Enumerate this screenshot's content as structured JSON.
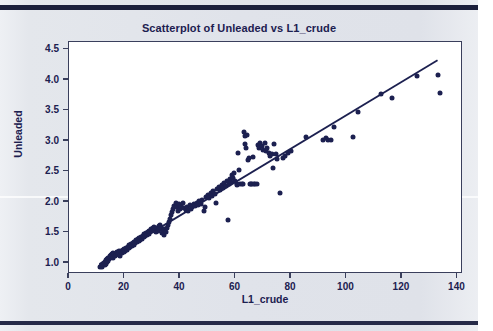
{
  "chart_data": {
    "type": "scatter",
    "title": "Scatterplot of Unleaded vs L1_crude",
    "xlabel": "L1_crude",
    "ylabel": "Unleaded",
    "xlim": [
      0,
      142
    ],
    "ylim": [
      0.82,
      4.62
    ],
    "xticks": [
      0,
      20,
      40,
      60,
      80,
      100,
      120,
      140
    ],
    "yticks": [
      "1.0",
      "1.5",
      "2.0",
      "2.5",
      "3.0",
      "3.5",
      "4.0",
      "4.5"
    ],
    "grid": false,
    "legend": "none",
    "marker_color": "#1c2050",
    "line_color": "#1c2050",
    "frame_color": "#3a3f5c",
    "background": "#ffffff",
    "fit_line": {
      "type": "linear",
      "x_start": 11.0,
      "y_start": 0.95,
      "x_end": 133.5,
      "y_end": 4.32,
      "slope": 0.0275,
      "intercept": 0.647
    },
    "points": [
      [
        11.2,
        0.93
      ],
      [
        11.6,
        0.95
      ],
      [
        12.0,
        0.94
      ],
      [
        12.1,
        0.98
      ],
      [
        12.4,
        0.96
      ],
      [
        12.6,
        1.0
      ],
      [
        12.8,
        0.97
      ],
      [
        13.0,
        1.02
      ],
      [
        13.2,
        0.99
      ],
      [
        13.4,
        1.05
      ],
      [
        13.6,
        1.01
      ],
      [
        13.8,
        1.07
      ],
      [
        14.0,
        1.04
      ],
      [
        14.2,
        1.09
      ],
      [
        14.4,
        1.06
      ],
      [
        14.6,
        1.11
      ],
      [
        14.8,
        1.08
      ],
      [
        15.0,
        1.13
      ],
      [
        15.2,
        1.1
      ],
      [
        15.4,
        1.15
      ],
      [
        15.6,
        1.12
      ],
      [
        15.8,
        1.17
      ],
      [
        16.0,
        1.09
      ],
      [
        16.2,
        1.14
      ],
      [
        16.5,
        1.11
      ],
      [
        16.8,
        1.16
      ],
      [
        17.0,
        1.13
      ],
      [
        17.3,
        1.18
      ],
      [
        17.6,
        1.15
      ],
      [
        17.9,
        1.2
      ],
      [
        18.2,
        1.17
      ],
      [
        18.5,
        1.12
      ],
      [
        18.8,
        1.19
      ],
      [
        19.1,
        1.16
      ],
      [
        19.4,
        1.21
      ],
      [
        19.7,
        1.18
      ],
      [
        20.0,
        1.23
      ],
      [
        20.3,
        1.2
      ],
      [
        20.6,
        1.25
      ],
      [
        20.9,
        1.22
      ],
      [
        21.2,
        1.27
      ],
      [
        21.5,
        1.24
      ],
      [
        21.8,
        1.29
      ],
      [
        22.1,
        1.26
      ],
      [
        22.4,
        1.31
      ],
      [
        22.7,
        1.28
      ],
      [
        23.0,
        1.33
      ],
      [
        23.3,
        1.3
      ],
      [
        23.6,
        1.35
      ],
      [
        23.9,
        1.32
      ],
      [
        24.2,
        1.37
      ],
      [
        24.5,
        1.34
      ],
      [
        24.8,
        1.39
      ],
      [
        25.1,
        1.36
      ],
      [
        25.4,
        1.41
      ],
      [
        25.7,
        1.38
      ],
      [
        26.0,
        1.43
      ],
      [
        26.3,
        1.4
      ],
      [
        26.6,
        1.45
      ],
      [
        26.9,
        1.42
      ],
      [
        27.2,
        1.47
      ],
      [
        27.5,
        1.44
      ],
      [
        27.8,
        1.49
      ],
      [
        28.1,
        1.46
      ],
      [
        28.4,
        1.51
      ],
      [
        28.7,
        1.48
      ],
      [
        29.0,
        1.53
      ],
      [
        29.3,
        1.5
      ],
      [
        29.6,
        1.55
      ],
      [
        29.9,
        1.52
      ],
      [
        30.2,
        1.57
      ],
      [
        30.5,
        1.54
      ],
      [
        30.8,
        1.59
      ],
      [
        31.1,
        1.56
      ],
      [
        31.4,
        1.51
      ],
      [
        31.7,
        1.58
      ],
      [
        32.0,
        1.53
      ],
      [
        32.3,
        1.6
      ],
      [
        32.6,
        1.55
      ],
      [
        32.9,
        1.62
      ],
      [
        33.2,
        1.57
      ],
      [
        33.5,
        1.49
      ],
      [
        33.8,
        1.52
      ],
      [
        34.1,
        1.46
      ],
      [
        34.4,
        1.55
      ],
      [
        34.8,
        1.5
      ],
      [
        35.2,
        1.58
      ],
      [
        35.6,
        1.63
      ],
      [
        36.0,
        1.67
      ],
      [
        36.4,
        1.72
      ],
      [
        36.8,
        1.78
      ],
      [
        37.2,
        1.83
      ],
      [
        37.6,
        1.88
      ],
      [
        38.0,
        1.94
      ],
      [
        38.4,
        1.99
      ],
      [
        38.8,
        1.91
      ],
      [
        39.2,
        1.86
      ],
      [
        39.6,
        1.96
      ],
      [
        40.0,
        1.89
      ],
      [
        40.5,
        1.93
      ],
      [
        41.0,
        1.98
      ],
      [
        41.5,
        1.9
      ],
      [
        42.0,
        1.87
      ],
      [
        42.5,
        1.92
      ],
      [
        43.0,
        1.85
      ],
      [
        43.5,
        1.95
      ],
      [
        44.0,
        1.88
      ],
      [
        44.5,
        1.91
      ],
      [
        45.0,
        1.96
      ],
      [
        45.5,
        1.93
      ],
      [
        46.0,
        1.99
      ],
      [
        46.5,
        1.95
      ],
      [
        47.0,
        2.01
      ],
      [
        47.5,
        1.97
      ],
      [
        48.0,
        2.04
      ],
      [
        48.5,
        1.86
      ],
      [
        49.0,
        1.91
      ],
      [
        49.5,
        2.08
      ],
      [
        50.0,
        2.12
      ],
      [
        50.5,
        2.07
      ],
      [
        51.0,
        2.15
      ],
      [
        51.5,
        2.1
      ],
      [
        52.0,
        2.18
      ],
      [
        52.5,
        2.13
      ],
      [
        53.0,
        1.98
      ],
      [
        53.5,
        2.21
      ],
      [
        54.0,
        2.25
      ],
      [
        54.5,
        2.2
      ],
      [
        55.0,
        2.28
      ],
      [
        55.5,
        2.23
      ],
      [
        56.0,
        2.31
      ],
      [
        56.5,
        2.26
      ],
      [
        57.0,
        2.34
      ],
      [
        57.3,
        1.7
      ],
      [
        57.6,
        2.29
      ],
      [
        58.0,
        2.37
      ],
      [
        58.4,
        2.32
      ],
      [
        58.8,
        2.44
      ],
      [
        59.2,
        2.4
      ],
      [
        59.6,
        2.48
      ],
      [
        60.0,
        2.35
      ],
      [
        60.4,
        2.3
      ],
      [
        60.6,
        2.28
      ],
      [
        61.0,
        2.8
      ],
      [
        61.4,
        2.52
      ],
      [
        61.8,
        2.3
      ],
      [
        62.2,
        2.3
      ],
      [
        62.6,
        2.29
      ],
      [
        63.0,
        3.14
      ],
      [
        63.3,
        3.08
      ],
      [
        63.6,
        2.95
      ],
      [
        63.9,
        2.88
      ],
      [
        64.2,
        3.1
      ],
      [
        64.5,
        2.69
      ],
      [
        64.8,
        2.72
      ],
      [
        65.2,
        2.3
      ],
      [
        65.6,
        2.29
      ],
      [
        66.0,
        2.3
      ],
      [
        66.4,
        2.74
      ],
      [
        66.8,
        2.3
      ],
      [
        67.2,
        2.3
      ],
      [
        67.6,
        2.29
      ],
      [
        68.0,
        2.93
      ],
      [
        68.5,
        2.88
      ],
      [
        69.0,
        2.97
      ],
      [
        69.5,
        2.92
      ],
      [
        70.0,
        2.85
      ],
      [
        70.5,
        2.96
      ],
      [
        71.0,
        2.83
      ],
      [
        71.5,
        2.88
      ],
      [
        72.0,
        2.8
      ],
      [
        72.5,
        2.76
      ],
      [
        73.0,
        2.79
      ],
      [
        73.5,
        2.56
      ],
      [
        74.0,
        2.95
      ],
      [
        74.5,
        2.78
      ],
      [
        75.0,
        2.7
      ],
      [
        76.0,
        2.15
      ],
      [
        77.0,
        2.72
      ],
      [
        78.0,
        2.75
      ],
      [
        79.0,
        2.81
      ],
      [
        80.0,
        2.83
      ],
      [
        85.5,
        3.07
      ],
      [
        91.5,
        3.02
      ],
      [
        92.5,
        3.04
      ],
      [
        93.5,
        3.01
      ],
      [
        94.5,
        3.02
      ],
      [
        95.5,
        3.23
      ],
      [
        102.5,
        3.06
      ],
      [
        104.0,
        3.47
      ],
      [
        112.5,
        3.77
      ],
      [
        116.5,
        3.71
      ],
      [
        125.5,
        4.06
      ],
      [
        133.0,
        4.08
      ],
      [
        133.8,
        3.79
      ]
    ]
  }
}
